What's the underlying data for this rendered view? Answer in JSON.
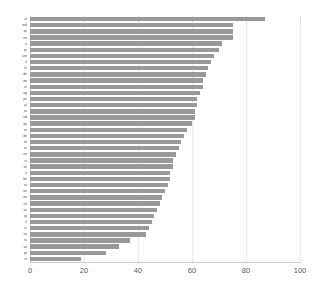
{
  "chart_data": {
    "type": "bar",
    "orientation": "horizontal",
    "title": "",
    "xlabel": "",
    "ylabel": "",
    "xlim": [
      0,
      100
    ],
    "xticks": [
      0,
      20,
      40,
      60,
      80,
      100
    ],
    "xtick_labels": [
      "0",
      "20",
      "40",
      "60",
      "80",
      "100"
    ],
    "grid": true,
    "grid_axis": "x",
    "legend": false,
    "bar_color": "#999999",
    "background_color": "#ffffff",
    "gridline_color": "#d8d8d8",
    "axis_color": "#c9c9c9",
    "categories": [
      "al",
      "md",
      "se",
      "no",
      "is",
      "pr",
      "am",
      "it",
      "la",
      "de",
      "mt",
      "ie",
      "ag",
      "pu",
      "pl",
      "ar",
      "nd",
      "by",
      "nr",
      "de",
      "sk",
      "sv",
      "en",
      "st",
      "vh",
      "tr",
      "be",
      "ro",
      "on",
      "ee",
      "ch",
      "ac",
      "gl",
      "cl",
      "tc",
      "ex",
      "ra",
      "va",
      "gr",
      "sr"
    ],
    "values": [
      87,
      75,
      75,
      75,
      71,
      70,
      68,
      67,
      66,
      65,
      64,
      64,
      63,
      62,
      62,
      61,
      61,
      60,
      58,
      57,
      56,
      55,
      54,
      53,
      53,
      52,
      52,
      51,
      50,
      49,
      48,
      47,
      46,
      45,
      44,
      43,
      37,
      33,
      28,
      19
    ]
  }
}
